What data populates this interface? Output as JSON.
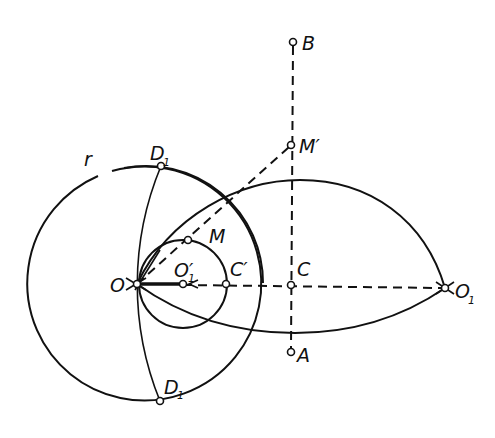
{
  "figure": {
    "type": "geometric-construction",
    "labels": {
      "B": "B",
      "M_prime": "M′",
      "D_top": "D",
      "D_top_sub": "1",
      "r": "r",
      "M": "M",
      "O": "O",
      "O_prime": "O′",
      "O_prime_sub": "1",
      "C_prime": "C′",
      "C": "C",
      "O1": "O",
      "O1_sub": "1",
      "A": "A",
      "D_bottom": "D",
      "D_bottom_sub": "1"
    },
    "points": {
      "B": [
        293,
        42
      ],
      "M_prime": [
        291,
        145
      ],
      "D_top": [
        161,
        166
      ],
      "M": [
        188,
        240
      ],
      "O": [
        137,
        284
      ],
      "O_prime": [
        183,
        284
      ],
      "C_prime": [
        226,
        284
      ],
      "C": [
        291,
        285
      ],
      "O1": [
        445,
        288
      ],
      "A": [
        291,
        352
      ],
      "D_bottom": [
        160,
        401
      ]
    },
    "circles": {
      "big_circle_r": {
        "center": [
          146,
          283
        ],
        "radius": 117
      },
      "small_circle": {
        "center": [
          183,
          284
        ],
        "radius": 44
      },
      "arc_D_D1": {
        "center": [
          445,
          288
        ],
        "radius": 309
      }
    },
    "colors": {
      "ink": "#111111",
      "background": "#ffffff"
    }
  }
}
